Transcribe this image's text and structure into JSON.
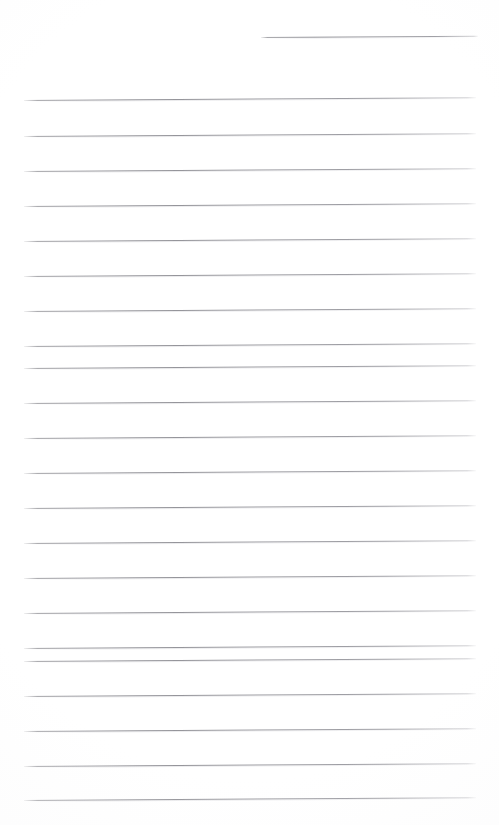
{
  "page": {
    "kind": "scanned-blank-ruled-page",
    "width": 499,
    "height": 825,
    "background_color": "#ffffff",
    "rule_color": "#93939a",
    "has_text": false,
    "written_content": "",
    "label": ""
  },
  "rules": {
    "count": 22,
    "full_width_count": 21,
    "short_count": 1,
    "spacing_px": 35,
    "left_x": 24,
    "right_x": 476,
    "first_full_y": 100,
    "last_full_y": 800,
    "tilt_deg": -0.35,
    "items": [
      {
        "name": "rule-00-header",
        "y": 37,
        "x": 261,
        "width": 217,
        "variant": "short"
      },
      {
        "name": "rule-01",
        "y": 100,
        "x": 24,
        "width": 452,
        "variant": "full"
      },
      {
        "name": "rule-02",
        "y": 136,
        "x": 24,
        "width": 452,
        "variant": "full"
      },
      {
        "name": "rule-03",
        "y": 171,
        "x": 24,
        "width": 452,
        "variant": "full"
      },
      {
        "name": "rule-04",
        "y": 206,
        "x": 24,
        "width": 452,
        "variant": "full"
      },
      {
        "name": "rule-05",
        "y": 241,
        "x": 24,
        "width": 452,
        "variant": "full"
      },
      {
        "name": "rule-06",
        "y": 276,
        "x": 24,
        "width": 452,
        "variant": "full"
      },
      {
        "name": "rule-07",
        "y": 311,
        "x": 24,
        "width": 452,
        "variant": "full"
      },
      {
        "name": "rule-08",
        "y": 346,
        "x": 24,
        "width": 452,
        "variant": "full"
      },
      {
        "name": "rule-09",
        "y": 368,
        "x": 24,
        "width": 452,
        "variant": "full"
      },
      {
        "name": "rule-10",
        "y": 403,
        "x": 24,
        "width": 452,
        "variant": "full"
      },
      {
        "name": "rule-11",
        "y": 438,
        "x": 24,
        "width": 452,
        "variant": "full"
      },
      {
        "name": "rule-12",
        "y": 473,
        "x": 24,
        "width": 452,
        "variant": "full"
      },
      {
        "name": "rule-13",
        "y": 508,
        "x": 24,
        "width": 452,
        "variant": "full"
      },
      {
        "name": "rule-14",
        "y": 543,
        "x": 24,
        "width": 452,
        "variant": "full"
      },
      {
        "name": "rule-15",
        "y": 578,
        "x": 24,
        "width": 452,
        "variant": "full"
      },
      {
        "name": "rule-16",
        "y": 613,
        "x": 24,
        "width": 452,
        "variant": "full"
      },
      {
        "name": "rule-17",
        "y": 648,
        "x": 24,
        "width": 452,
        "variant": "full"
      },
      {
        "name": "rule-18",
        "y": 661,
        "x": 24,
        "width": 452,
        "variant": "full"
      },
      {
        "name": "rule-19",
        "y": 696,
        "x": 24,
        "width": 452,
        "variant": "full"
      },
      {
        "name": "rule-20",
        "y": 731,
        "x": 24,
        "width": 452,
        "variant": "full"
      },
      {
        "name": "rule-21",
        "y": 766,
        "x": 24,
        "width": 452,
        "variant": "full"
      },
      {
        "name": "rule-22",
        "y": 800,
        "x": 24,
        "width": 452,
        "variant": "full"
      }
    ]
  }
}
